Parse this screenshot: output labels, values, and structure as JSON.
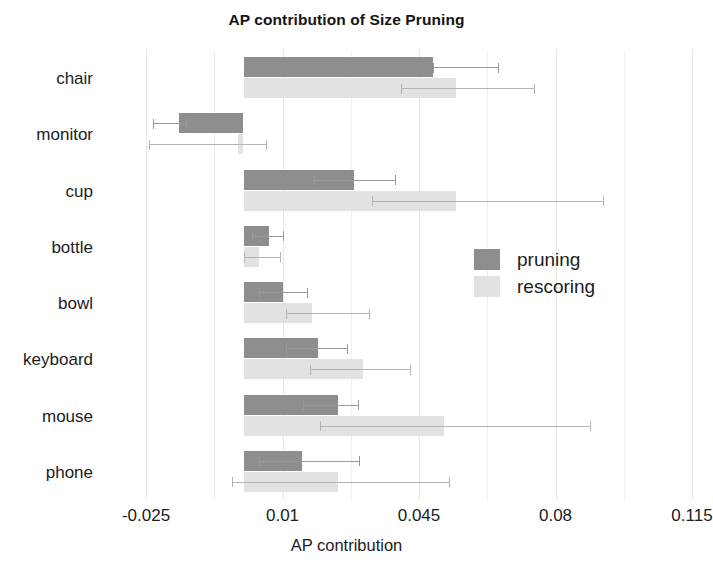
{
  "chart_data": {
    "type": "bar",
    "orientation": "horizontal",
    "title": "AP contribution of Size Pruning",
    "xlabel": "AP contribution",
    "ylabel": "",
    "xlim": [
      -0.025,
      0.115
    ],
    "xticks": [
      "-0.025",
      "0.01",
      "0.045",
      "0.08",
      "0.115"
    ],
    "xtick_values": [
      -0.025,
      0.01,
      0.045,
      0.08,
      0.115
    ],
    "grid": true,
    "legend_position": "center-right",
    "categories": [
      "chair",
      "monitor",
      "cup",
      "bottle",
      "bowl",
      "keyboard",
      "mouse",
      "phone"
    ],
    "series": [
      {
        "name": "pruning",
        "color": "#8e8e8e",
        "values": [
          0.0486,
          -0.0165,
          0.0283,
          0.0065,
          0.01,
          0.019,
          0.0242,
          0.015
        ],
        "err_low": [
          0.0486,
          -0.0232,
          0.018,
          0.0021,
          0.0041,
          0.0108,
          0.0153,
          0.004
        ],
        "err_high": [
          0.0655,
          -0.0144,
          0.039,
          0.0103,
          0.0165,
          0.0268,
          0.0295,
          0.0298
        ]
      },
      {
        "name": "rescoring",
        "color": "#e2e2e2",
        "values": [
          0.0545,
          -0.0015,
          0.0545,
          0.004,
          0.0175,
          0.0306,
          0.0515,
          0.0242
        ],
        "err_low": [
          0.0404,
          -0.0242,
          0.033,
          0.0,
          0.011,
          0.017,
          0.0195,
          -0.003
        ],
        "err_high": [
          0.0748,
          0.006,
          0.0925,
          0.0095,
          0.0325,
          0.043,
          0.089,
          0.053
        ]
      }
    ]
  },
  "legend": {
    "items": [
      {
        "label": "pruning",
        "color": "#8e8e8e"
      },
      {
        "label": "rescoring",
        "color": "#e2e2e2"
      }
    ]
  }
}
